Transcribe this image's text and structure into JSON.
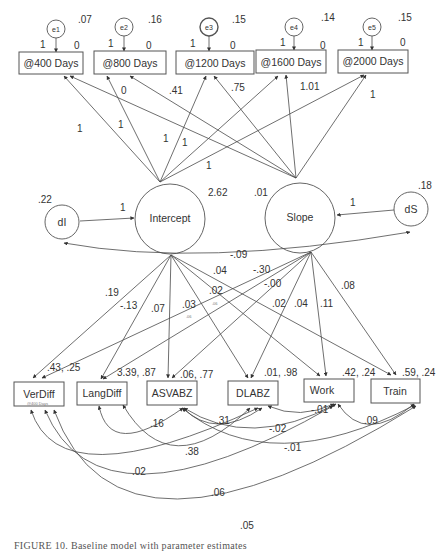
{
  "diagram": {
    "type": "structural-equation-model / latent growth curve path diagram",
    "caption": "FIGURE 10. Baseline model with parameter estimates",
    "observed_top": [
      {
        "id": "d400",
        "label": "@400 Days",
        "error": "e1",
        "error_variance": ".07",
        "error_loading": "1",
        "mean": "0"
      },
      {
        "id": "d800",
        "label": "@800 Days",
        "error": "e2",
        "error_variance": ".16",
        "error_loading": "1",
        "mean": "0"
      },
      {
        "id": "d1200",
        "label": "@1200 Days",
        "error": "e3",
        "error_variance": ".15",
        "error_loading": "1",
        "mean": "0"
      },
      {
        "id": "d1600",
        "label": "@1600 Days",
        "error": "e4",
        "error_variance": ".14",
        "error_loading": "1",
        "mean": "0"
      },
      {
        "id": "d2000",
        "label": "@2000 Days",
        "error": "e5",
        "error_variance": ".15",
        "error_loading": "1",
        "mean": "0"
      }
    ],
    "latent": {
      "intercept": {
        "label": "Intercept",
        "estimate": "2.62"
      },
      "slope": {
        "label": "Slope",
        "estimate": ".01"
      }
    },
    "disturbances": {
      "dI": {
        "label": "dI",
        "variance": ".22",
        "loading": "1"
      },
      "dS": {
        "label": "dS",
        "variance": ".18",
        "loading": "1"
      },
      "covariance": "-.09"
    },
    "loadings": {
      "intercept": [
        "1",
        "1",
        "1",
        "1",
        "1"
      ],
      "slope": [
        "0",
        ".41",
        ".75",
        "1.01",
        "1"
      ]
    },
    "observed_bottom": [
      {
        "id": "verdiff",
        "label": "VerDiff",
        "stats": ".43, .25",
        "sublabel": "@400 Days"
      },
      {
        "id": "langdiff",
        "label": "LangDiff",
        "stats": "3.39, .87"
      },
      {
        "id": "asvabz",
        "label": "ASVABZ",
        "stats": ".06, .77"
      },
      {
        "id": "dlabz",
        "label": "DLABZ",
        "stats": ".01, .98"
      },
      {
        "id": "work",
        "label": "Work",
        "stats": ".42, .24"
      },
      {
        "id": "train",
        "label": "Train",
        "stats": ".59, .24"
      }
    ],
    "regressions": {
      "intercept_on": {
        "verdiff": ".19",
        "langdiff": "-.13",
        "asvabz": ".07",
        "dlabz": ".03",
        "work": ".02",
        "train": ".04"
      },
      "slope_on": {
        "verdiff": "-.30",
        "langdiff": "-.00",
        "asvabz": ".02",
        "dlabz": ".04",
        "work": ".11",
        "train": ".08"
      },
      "small_annotations": [
        ".06",
        ".06"
      ]
    },
    "covariances": [
      {
        "label": ".16"
      },
      {
        "label": ".31"
      },
      {
        "label": ".38"
      },
      {
        "label": "-.01"
      },
      {
        "label": "-.02"
      },
      {
        "label": ".09"
      },
      {
        "label": "-.01"
      },
      {
        "label": ".02"
      },
      {
        "label": ".06"
      },
      {
        "label": ".05"
      }
    ]
  }
}
